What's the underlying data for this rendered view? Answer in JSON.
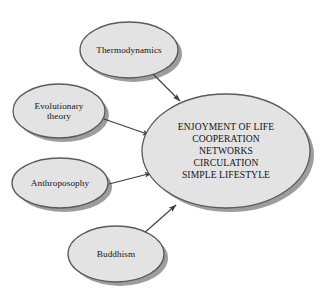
{
  "diagram": {
    "type": "concept-convergence",
    "background_color": "#ffffff",
    "node_fill": "#e3e3e3",
    "node_stroke": "#5a5a5a",
    "node_shadow": "#9a9a9a",
    "text_color": "#141414",
    "arrow_color": "#3c3c3c",
    "central_node": {
      "id": "outcome",
      "label": "ENJOYMENT OF LIFE\nCOOPERATION\nNETWORKS\nCIRCULATION\nSIMPLE LIFESTYLE",
      "lines": [
        "ENJOYMENT OF LIFE",
        "COOPERATION",
        "NETWORKS",
        "CIRCULATION",
        "SIMPLE LIFESTYLE"
      ],
      "shape": "ellipse",
      "cx": 226,
      "cy": 151,
      "rx": 84,
      "ry": 57
    },
    "source_nodes": [
      {
        "id": "thermodynamics",
        "label": "Thermodynamics",
        "shape": "ellipse",
        "cx": 129,
        "cy": 50,
        "rx": 49,
        "ry": 28
      },
      {
        "id": "evolutionary-theory",
        "label": "Evolutionary\ntheory",
        "shape": "ellipse",
        "cx": 59,
        "cy": 111,
        "rx": 46,
        "ry": 27
      },
      {
        "id": "anthroposophy",
        "label": "Anthroposophy",
        "shape": "ellipse",
        "cx": 60,
        "cy": 183,
        "rx": 48,
        "ry": 25
      },
      {
        "id": "buddhism",
        "label": "Buddhism",
        "shape": "ellipse",
        "cx": 116,
        "cy": 254,
        "rx": 48,
        "ry": 28
      }
    ],
    "arrows": [
      {
        "id": "arrow-thermodynamics-to-outcome",
        "from": "thermodynamics",
        "to": "outcome",
        "x1": 152,
        "y1": 73,
        "x2": 180,
        "y2": 101
      },
      {
        "id": "arrow-evolutionary-theory-to-outcome",
        "from": "evolutionary-theory",
        "to": "outcome",
        "x1": 104,
        "y1": 119,
        "x2": 150,
        "y2": 135
      },
      {
        "id": "arrow-anthroposophy-to-outcome",
        "from": "anthroposophy",
        "to": "outcome",
        "x1": 109,
        "y1": 184,
        "x2": 152,
        "y2": 173
      },
      {
        "id": "arrow-buddhism-to-outcome",
        "from": "buddhism",
        "to": "outcome",
        "x1": 143,
        "y1": 234,
        "x2": 176,
        "y2": 205
      }
    ]
  }
}
